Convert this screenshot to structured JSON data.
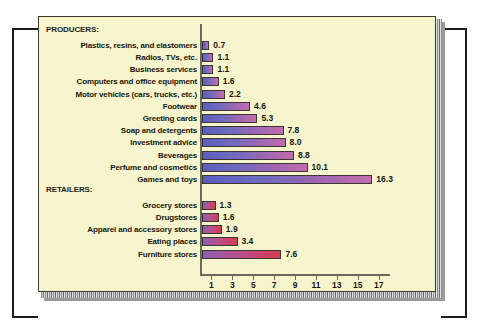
{
  "figure": {
    "background_color": "#f7f5ce",
    "page_background": "#ffffff",
    "frame_color": "#1b1b1b"
  },
  "chart_data": {
    "type": "bar",
    "orientation": "horizontal",
    "title": "",
    "subtitle": "",
    "xlabel": "Advertising as percent of sales",
    "ylabel": "",
    "xlim": [
      0,
      18
    ],
    "grid": false,
    "legend": "none",
    "tick_labels": [
      "1",
      "3",
      "5",
      "7",
      "9",
      "11",
      "13",
      "15",
      "17"
    ],
    "ticks": [
      1,
      3,
      5,
      7,
      9,
      11,
      13,
      15,
      17
    ],
    "groups": [
      {
        "name": "PRODUCERS:",
        "color_start": "#5b5fc0",
        "color_end": "#c46bb0",
        "categories": [
          "Plastics, resins, and elastomers",
          "Radios, TVs, etc.",
          "Business services",
          "Computers and office equipment",
          "Motor vehicles (cars, trucks, etc.)",
          "Footwear",
          "Greeting cards",
          "Soap and detergents",
          "Investment advice",
          "Beverages",
          "Perfume and cosmetics",
          "Games and toys"
        ],
        "values": [
          0.7,
          1.1,
          1.1,
          1.6,
          2.2,
          4.6,
          5.3,
          7.8,
          8.0,
          8.8,
          10.1,
          16.3
        ],
        "value_labels": [
          "0.7",
          "1.1",
          "1.1",
          "1.6",
          "2.2",
          "4.6",
          "5.3",
          "7.8",
          "8.0",
          "8.8",
          "10.1",
          "16.3"
        ]
      },
      {
        "name": "RETAILERS:",
        "color_start": "#8f5fae",
        "color_end": "#d83b50",
        "categories": [
          "Grocery stores",
          "Drugstores",
          "Apparel and accessory stores",
          "Eating places",
          "Furniture stores"
        ],
        "values": [
          1.3,
          1.6,
          1.9,
          3.4,
          7.6
        ],
        "value_labels": [
          "1.3",
          "1.6",
          "1.9",
          "3.4",
          "7.6"
        ]
      }
    ]
  }
}
